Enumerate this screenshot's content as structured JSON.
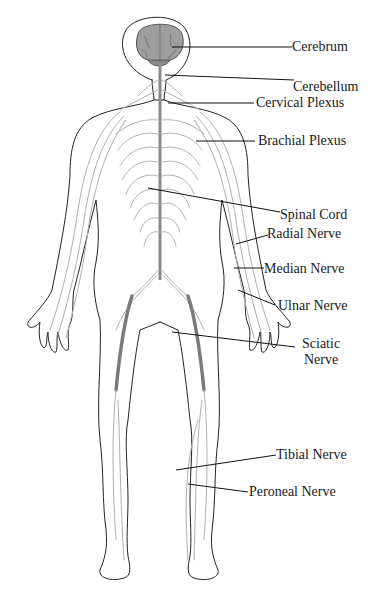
{
  "diagram": {
    "colors": {
      "background": "#ffffff",
      "outline": "#222222",
      "nerve": "#b0b0b0",
      "brain": "#9e9e9e",
      "leader": "#111111",
      "text": "#1a1a1a"
    },
    "labels": [
      {
        "id": "cerebrum",
        "text": "Cerebrum"
      },
      {
        "id": "cerebellum",
        "text": "Cerebellum"
      },
      {
        "id": "cervical-plexus",
        "text": "Cervical Plexus"
      },
      {
        "id": "brachial-plexus",
        "text": "Brachial Plexus"
      },
      {
        "id": "spinal-cord",
        "text": "Spinal Cord"
      },
      {
        "id": "radial-nerve",
        "text": "Radial Nerve"
      },
      {
        "id": "median-nerve",
        "text": "Median Nerve"
      },
      {
        "id": "ulnar-nerve",
        "text": "Ulnar Nerve"
      },
      {
        "id": "sciatic-nerve",
        "text": "Sciatic",
        "text2": "Nerve"
      },
      {
        "id": "tibial-nerve",
        "text": "Tibial Nerve"
      },
      {
        "id": "peroneal-nerve",
        "text": "Peroneal Nerve"
      }
    ]
  }
}
